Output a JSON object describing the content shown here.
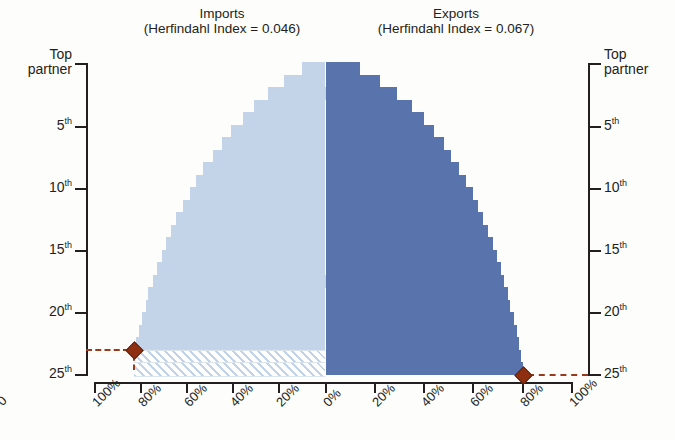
{
  "chart_data": {
    "type": "bar",
    "orientation": "horizontal-mirrored",
    "title": "",
    "panels": [
      {
        "name": "imports",
        "label": "Imports",
        "sublabel": "(Herfindahl Index = 0.046)",
        "side": "left",
        "color": "#c3d3e8",
        "xlabel": "",
        "ticklabels": [
          "100%",
          "80%",
          "60%",
          "40%",
          "20%",
          "0%"
        ],
        "tickvalues": [
          100,
          80,
          60,
          40,
          20,
          0
        ],
        "xlim": [
          100,
          0
        ],
        "marker": {
          "rank": 23,
          "value": 83,
          "color": "#8e2f12",
          "shape": "diamond"
        },
        "hatched_from_rank": 24,
        "values": [
          10,
          18,
          25,
          31,
          36,
          41,
          45,
          49,
          53,
          56,
          59,
          62,
          65,
          67,
          69,
          71,
          73,
          75,
          77,
          78,
          79.5,
          81,
          82,
          83,
          83
        ]
      },
      {
        "name": "exports",
        "label": "Exports",
        "sublabel": "(Herfindahl Index = 0.067)",
        "side": "right",
        "color": "#5974ac",
        "xlabel": "",
        "ticklabels": [
          "0%",
          "20%",
          "40%",
          "60%",
          "80%",
          "100%"
        ],
        "tickvalues": [
          0,
          20,
          40,
          60,
          80,
          100
        ],
        "xlim": [
          0,
          100
        ],
        "marker": {
          "rank": 25,
          "value": 80,
          "color": "#8e2f12",
          "shape": "diamond"
        },
        "values": [
          14,
          22,
          29,
          35,
          40,
          44,
          48,
          51,
          54,
          57,
          60,
          62,
          64,
          66,
          68,
          69.5,
          71,
          72.5,
          74,
          75,
          76.5,
          77.5,
          78.5,
          79.5,
          80
        ]
      }
    ],
    "yaxis": {
      "label_left": [
        "Top",
        "partner"
      ],
      "label_right": [
        "Top",
        "partner"
      ],
      "ticklabels": [
        "Top partner",
        "5th",
        "10th",
        "15th",
        "20th",
        "25th"
      ],
      "tickranks": [
        1,
        5,
        10,
        15,
        20,
        25
      ],
      "ranks": 25,
      "grid": false
    },
    "legend": {
      "position": "none"
    }
  },
  "axis": {
    "y_top_left_1": "Top",
    "y_top_left_2": "partner",
    "y_top_right_1": "Top",
    "y_top_right_2": "partner",
    "y5": "5",
    "y10": "10",
    "y15": "15",
    "y20": "20",
    "y25": "25",
    "ord": "th",
    "edge_clip": "0"
  }
}
